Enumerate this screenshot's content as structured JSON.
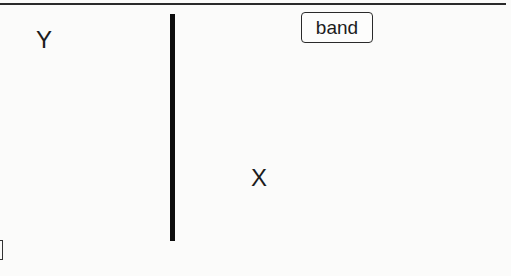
{
  "diagram": {
    "labels": {
      "y_label": "Y",
      "x_label": "X"
    },
    "band_box": {
      "label": "band"
    },
    "elements": {
      "top_rule": "horizontal-line",
      "divider": "vertical-bar",
      "bottom_left_fragment": "bracket"
    },
    "colors": {
      "background": "#fbfbfa",
      "ink": "#1a1a1a",
      "bar": "#0d0d0d"
    }
  }
}
